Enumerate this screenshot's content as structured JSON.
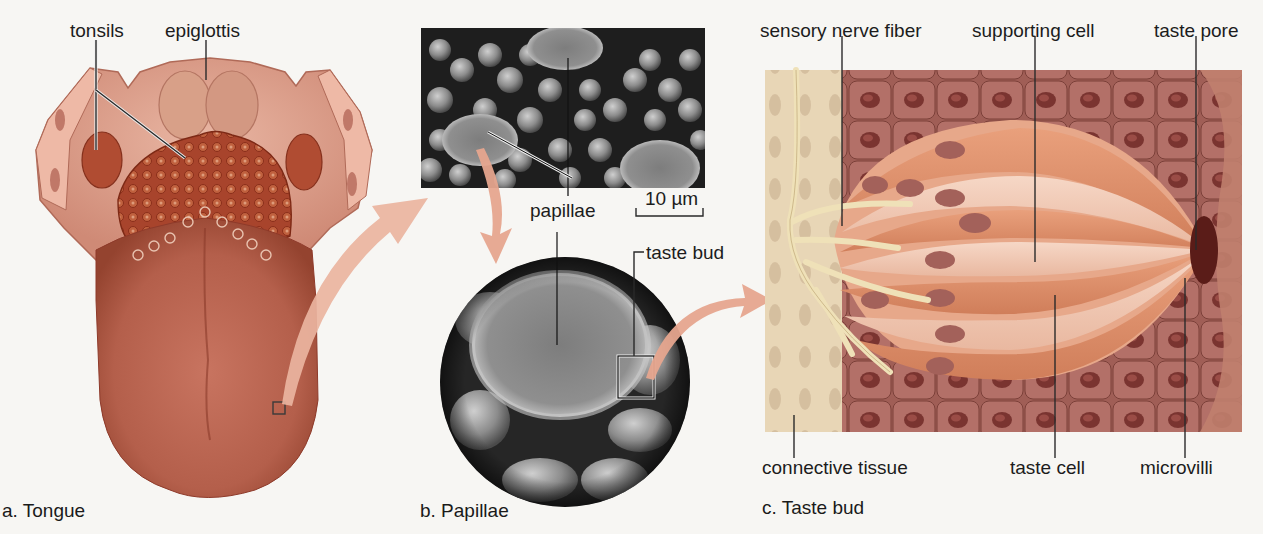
{
  "figure": {
    "panels": [
      {
        "id": "a",
        "caption": "a. Tongue",
        "labels": {
          "tonsils": "tonsils",
          "epiglottis": "epiglottis"
        }
      },
      {
        "id": "b",
        "caption": "b. Papillae",
        "labels": {
          "papillae": "papillae",
          "taste_bud": "taste bud",
          "scale_bar": "10 µm"
        }
      },
      {
        "id": "c",
        "caption": "c. Taste bud",
        "labels": {
          "sensory_nerve_fiber": "sensory nerve fiber",
          "supporting_cell": "supporting cell",
          "taste_pore": "taste pore",
          "connective_tissue": "connective tissue",
          "taste_cell": "taste cell",
          "microvilli": "microvilli"
        }
      }
    ],
    "colors": {
      "background": "#f7f6f3",
      "tongue": "#b8624e",
      "tongue_dark": "#8e3a2a",
      "arrow": "#e6a58e",
      "sem_dark": "#1e1e1e",
      "sem_light": "#9a9a9a",
      "connective": "#e6d2b0",
      "epithelium": "#9c5a52",
      "taste_cell": "#e59a74",
      "supporting_cell": "#f1c7b0",
      "nerve": "#efe1b8"
    }
  }
}
